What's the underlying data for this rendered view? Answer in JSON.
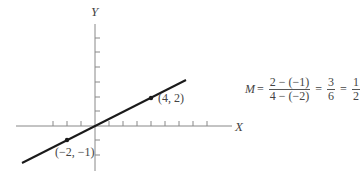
{
  "diagram": {
    "axes": {
      "x_label": "X",
      "y_label": "Y"
    },
    "points": [
      {
        "label": "(4, 2)",
        "x": 4,
        "y": 2
      },
      {
        "label": "(−2, −1)",
        "x": -2,
        "y": -1
      }
    ],
    "equation": {
      "lhs": "M",
      "eq": "=",
      "frac1_num": "2 − (−1)",
      "frac1_den": "4 − (−2)",
      "frac2_num": "3",
      "frac2_den": "6",
      "frac3_num": "1",
      "frac3_den": "2"
    },
    "colors": {
      "line": "#1a1a1a",
      "axis": "#777777",
      "text": "#444444"
    }
  }
}
